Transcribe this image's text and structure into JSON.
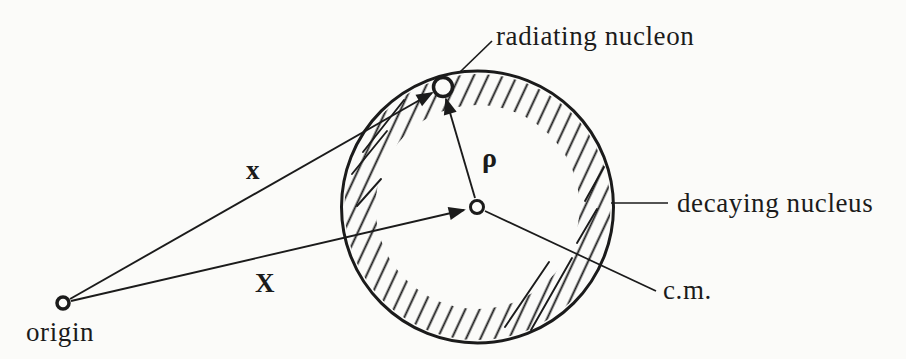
{
  "figure": {
    "labels": {
      "radiating_nucleon": "radiating nucleon",
      "decaying_nucleus": "decaying nucleus",
      "cm": "c.m.",
      "origin": "origin",
      "vector_x": "x",
      "vector_X": "X",
      "vector_rho": "ρ"
    },
    "colors": {
      "ink": "#1b1b1b",
      "paper": "#fbfbf9"
    }
  }
}
